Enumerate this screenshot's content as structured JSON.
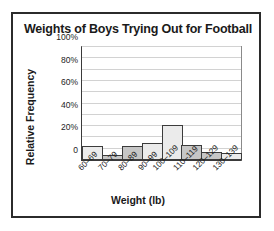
{
  "chart_data": {
    "type": "bar",
    "title": "Weights of Boys Trying Out for Football",
    "xlabel": "Weight (lb)",
    "ylabel": "Relative Frequency",
    "categories": [
      "60–69",
      "70–79",
      "80–89",
      "90–99",
      "100–109",
      "110–119",
      "120–129",
      "130–139"
    ],
    "values": [
      12,
      4,
      12,
      15,
      31,
      13,
      7,
      6
    ],
    "ylim": [
      0,
      100
    ],
    "yticks": [
      0,
      10,
      20,
      30,
      40,
      50,
      60,
      70,
      80,
      90,
      100
    ],
    "ytick_labels": [
      "0",
      "",
      "20%",
      "",
      "40%",
      "",
      "60%",
      "",
      "80%",
      "",
      "100%"
    ],
    "grid": true,
    "legend": "none",
    "bar_shades": [
      "light",
      "dark",
      "dark",
      "light",
      "light",
      "dark",
      "dark",
      "light"
    ]
  },
  "colors": {
    "frame": "#2b2b2b",
    "axis": "#3a3a3a",
    "gridline": "#d2d2d2",
    "bar_light": "#ebebeb",
    "bar_dark": "#c6c6c6",
    "bar_outline": "#3c3c3c",
    "text": "#1a1a1a",
    "background": "#ffffff"
  }
}
